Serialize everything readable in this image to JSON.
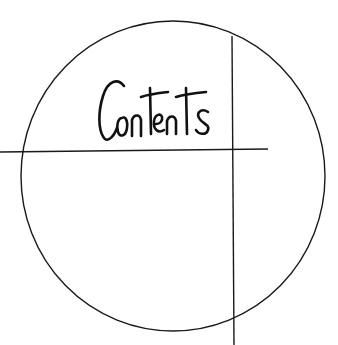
{
  "title": "Contents",
  "colors": {
    "background": "#ffffff",
    "stroke": "#1a1a1a"
  },
  "shapes": {
    "circle": {
      "cx": 173,
      "cy": 176,
      "rx": 152,
      "ry": 155
    },
    "horizontal_line": {
      "x1": 0,
      "y1": 152,
      "x2": 268,
      "y2": 149
    },
    "vertical_line": {
      "x1": 232,
      "y1": 36,
      "x2": 234,
      "y2": 345
    }
  }
}
